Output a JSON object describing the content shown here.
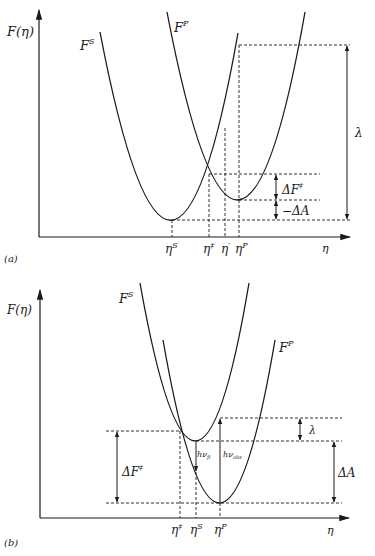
{
  "panels": [
    {
      "id": "a",
      "caption": "(a)",
      "y_axis_label": "F(η)",
      "x_axis_label": "η",
      "curves": [
        {
          "name": "F",
          "sup": "S"
        },
        {
          "name": "F",
          "sup": "P"
        }
      ],
      "x_ticks": [
        {
          "base": "η",
          "sup": "S"
        },
        {
          "base": "η",
          "sup": "‡"
        },
        {
          "base": "η",
          "sup": "′"
        },
        {
          "base": "η",
          "sup": "P"
        }
      ],
      "annotations": {
        "lambda": "λ",
        "delta_f": {
          "base": "ΔF",
          "sup": "‡"
        },
        "neg_delta_a": "−ΔA"
      }
    },
    {
      "id": "b",
      "caption": "(b)",
      "y_axis_label": "F(η)",
      "x_axis_label": "η",
      "curves": [
        {
          "name": "F",
          "sup": "S"
        },
        {
          "name": "F",
          "sup": "P"
        }
      ],
      "x_ticks": [
        {
          "base": "η",
          "sup": "‡"
        },
        {
          "base": "η",
          "sup": "S"
        },
        {
          "base": "η",
          "sup": "P"
        }
      ],
      "annotations": {
        "lambda": "λ",
        "delta_f": {
          "base": "ΔF",
          "sup": "‡"
        },
        "delta_a": "ΔA",
        "h_nu_fl": {
          "base": "hν",
          "sub": "fl"
        },
        "h_nu_abs": {
          "base": "hν",
          "sub": "abs"
        }
      }
    }
  ]
}
